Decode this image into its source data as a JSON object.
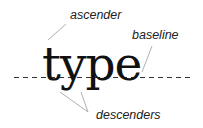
{
  "diagram": {
    "word": "type",
    "labels": {
      "ascender": "ascender",
      "baseline": "baseline",
      "descenders": "descenders"
    },
    "colors": {
      "text": "#111111",
      "label": "#222222",
      "pointer": "#b0b0b0",
      "baseline_dash": "#333333"
    }
  }
}
